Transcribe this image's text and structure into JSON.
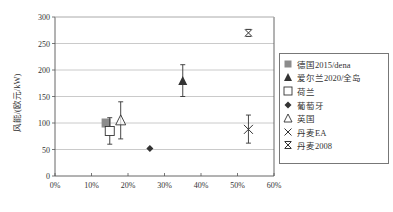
{
  "chart_data": {
    "type": "scatter",
    "title": "",
    "xlabel": "",
    "ylabel": "风能/(欧元/kW)",
    "xlim": [
      0,
      60
    ],
    "ylim": [
      0,
      300
    ],
    "x_ticks": [
      "0%",
      "10%",
      "20%",
      "30%",
      "40%",
      "50%",
      "60%"
    ],
    "y_ticks": [
      "0",
      "50",
      "100",
      "150",
      "200",
      "250",
      "300"
    ],
    "grid": "horizontal",
    "legend_position": "right",
    "series": [
      {
        "name": "德国2015/dena",
        "marker": "filled-square",
        "color": "#8c8c8c",
        "x": 14,
        "y": 100,
        "err_low": null,
        "err_high": null
      },
      {
        "name": "爱尔兰2020/全岛",
        "marker": "filled-triangle",
        "color": "#333333",
        "x": 35,
        "y": 180,
        "err_low": 150,
        "err_high": 210
      },
      {
        "name": "荷兰",
        "marker": "open-square",
        "color": "#333333",
        "x": 15,
        "y": 85,
        "err_low": 60,
        "err_high": 110
      },
      {
        "name": "葡萄牙",
        "marker": "filled-diamond",
        "color": "#333333",
        "x": 26,
        "y": 52,
        "err_low": null,
        "err_high": null
      },
      {
        "name": "英国",
        "marker": "open-triangle",
        "color": "#333333",
        "x": 18,
        "y": 105,
        "err_low": 70,
        "err_high": 140
      },
      {
        "name": "丹麦EA",
        "marker": "x",
        "color": "#333333",
        "x": 53,
        "y": 88,
        "err_low": 62,
        "err_high": 115
      },
      {
        "name": "丹麦2008",
        "marker": "asterisk-x",
        "color": "#333333",
        "x": 53,
        "y": 270,
        "err_low": null,
        "err_high": null
      }
    ]
  },
  "legend": {
    "items": [
      "德国2015/dena",
      "爱尔兰2020/全岛",
      "荷兰",
      "葡萄牙",
      "英国",
      "丹麦EA",
      "丹麦2008"
    ]
  },
  "axis": {
    "ylabel": "风能/(欧元/kW)"
  }
}
